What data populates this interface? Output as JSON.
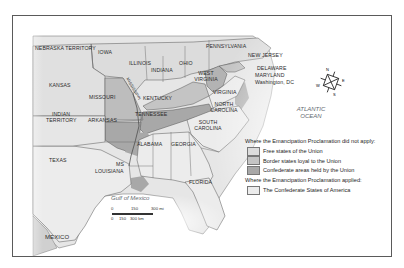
{
  "map": {
    "colors": {
      "free_states": "#dcdcdc",
      "border_states": "#c4c4c4",
      "confederate_union_held": "#a8a8a8",
      "confederate_states": "#ececec",
      "state_border": "#555555",
      "frame": "#5a5a5a"
    },
    "state_labels": {
      "nebraska": "Nebraska Territory",
      "iowa": "Iowa",
      "illinois": "Illinois",
      "indiana": "Indiana",
      "ohio": "Ohio",
      "pennsylvania": "Pennsylvania",
      "new_jersey": "New Jersey",
      "delaware": "Delaware",
      "maryland": "Maryland",
      "washington_dc": "Washington, DC",
      "west_virginia": "West Virginia",
      "virginia": "Virginia",
      "kansas": "Kansas",
      "missouri": "Missouri",
      "mississippi_river": "Mississippi",
      "kentucky": "Kentucky",
      "north_carolina": "North Carolina",
      "indian_territory": "Indian Territory",
      "arkansas": "Arkansas",
      "tennessee": "Tennessee",
      "south_carolina": "South Carolina",
      "texas": "Texas",
      "ms": "MS",
      "alabama": "Alabama",
      "georgia": "Georgia",
      "louisiana": "Louisiana",
      "florida": "Florida",
      "mexico": "Mexico"
    },
    "water_labels": {
      "atlantic": "ATLANTIC OCEAN",
      "gulf": "Gulf of Mexico"
    },
    "compass": {
      "n": "N",
      "e": "E",
      "s": "S",
      "w": "W"
    },
    "scale": {
      "mi_ticks": [
        "0",
        "150",
        "300 mi"
      ],
      "km_ticks": [
        "0",
        "150",
        "300 km"
      ]
    },
    "legend": {
      "heading_not_applied": "Where the Emancipation Proclamation did not apply:",
      "items_not_applied": [
        {
          "label": "Free states of the Union",
          "color": "#dcdcdc"
        },
        {
          "label": "Border states loyal to the Union",
          "color": "#c4c4c4"
        },
        {
          "label": "Confederate areas held by the Union",
          "color": "#a8a8a8"
        }
      ],
      "heading_applied": "Where the Emancipation Proclamation applied:",
      "items_applied": [
        {
          "label": "The Confederate States of America",
          "color": "#ececec"
        }
      ]
    }
  }
}
